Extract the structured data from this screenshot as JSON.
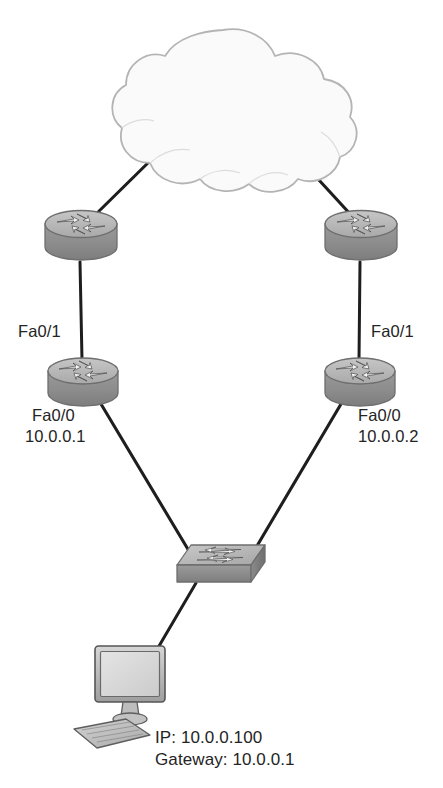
{
  "diagram": {
    "type": "network-topology",
    "width": 443,
    "height": 788,
    "background_color": "#ffffff"
  },
  "palette": {
    "line_color": "#1e1e1e",
    "text_color": "#242424",
    "cloud_fill": "#fafafa",
    "cloud_stroke": "#b4b4b4",
    "device_top_fill": "#b6b6b6",
    "device_body_fill": "#8e8e8e",
    "device_stroke": "#6e6e6e",
    "device_highlight": "#d8d8d8",
    "screen_fill": "#dcdcdc",
    "screen_stroke": "#6a6a6a"
  },
  "nodes": [
    {
      "id": "internet-cloud",
      "name": "cloud",
      "kind": "cloud",
      "label": "",
      "cx": 223,
      "cy": 110,
      "rx": 100,
      "ry": 78
    },
    {
      "id": "router-top-left",
      "name": "router",
      "kind": "router",
      "label": "",
      "cx": 81,
      "cy": 236,
      "w": 72,
      "h": 52
    },
    {
      "id": "router-top-right",
      "name": "router",
      "kind": "router",
      "label": "",
      "cx": 361,
      "cy": 236,
      "w": 72,
      "h": 52
    },
    {
      "id": "router-left",
      "name": "router",
      "kind": "router",
      "label": "",
      "cx": 83,
      "cy": 382,
      "w": 70,
      "h": 51
    },
    {
      "id": "router-right",
      "name": "router",
      "kind": "router",
      "label": "",
      "cx": 360,
      "cy": 382,
      "w": 70,
      "h": 51
    },
    {
      "id": "switch",
      "name": "switch",
      "kind": "switch",
      "label": "",
      "cx": 221,
      "cy": 563,
      "w": 88,
      "h": 42
    },
    {
      "id": "host-pc",
      "name": "workstation",
      "kind": "computer",
      "label": "",
      "cx": 130,
      "cy": 685,
      "w": 80,
      "h": 90
    }
  ],
  "links": [
    {
      "from": "internet-cloud",
      "to": "router-top-left",
      "style": "solid"
    },
    {
      "from": "internet-cloud",
      "to": "router-top-right",
      "style": "solid"
    },
    {
      "from": "router-top-left",
      "to": "router-left",
      "style": "solid"
    },
    {
      "from": "router-top-right",
      "to": "router-right",
      "style": "solid"
    },
    {
      "from": "router-left",
      "to": "switch",
      "style": "solid"
    },
    {
      "from": "router-right",
      "to": "switch",
      "style": "solid"
    },
    {
      "from": "switch",
      "to": "host-pc",
      "style": "solid"
    }
  ],
  "labels": {
    "left_router_uplink_interface": "Fa0/1",
    "left_router_lan_interface": "Fa0/0",
    "left_router_lan_ip": "10.0.0.1",
    "right_router_uplink_interface": "Fa0/1",
    "right_router_lan_interface": "Fa0/0",
    "right_router_lan_ip": "10.0.0.2",
    "host_ip": "IP: 10.0.0.100",
    "host_gateway": "Gateway: 10.0.0.1"
  }
}
